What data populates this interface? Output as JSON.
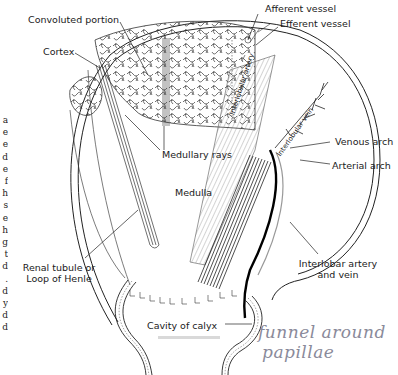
{
  "figure": {
    "labels": {
      "convoluted_portion": "Convoluted portion",
      "cortex": "Cortex",
      "afferent_vessel": "Afferent vessel",
      "efferent_vessel": "Efferent vessel",
      "interlobular_artery": "Interlobular artery",
      "interlobular_vein": "Interlobular vein",
      "medullary_rays": "Medullary rays",
      "medulla": "Medulla",
      "venous_arch": "Venous arch",
      "arterial_arch": "Arterial arch",
      "renal_tubule_line1": "Renal tubule or",
      "renal_tubule_line2": "Loop of Henle",
      "interlobar_line1": "Interlobar artery",
      "interlobar_line2": "and vein",
      "cavity_of_calyx": "Cavity of calyx"
    },
    "handwritten_note": {
      "line1": "funnel around",
      "line2": "papillae",
      "color": "#8a8a9a"
    },
    "cropped_side_text": [
      "a",
      "e",
      "e",
      "d",
      "e",
      "f",
      "h",
      "s",
      "e",
      "h",
      "g",
      "t",
      "d",
      ".",
      " ",
      "d",
      "y",
      "d",
      "d"
    ],
    "colors": {
      "ink": "#1a1a1a",
      "background": "#ffffff",
      "highlight_bar": "#d9d9d9"
    }
  }
}
